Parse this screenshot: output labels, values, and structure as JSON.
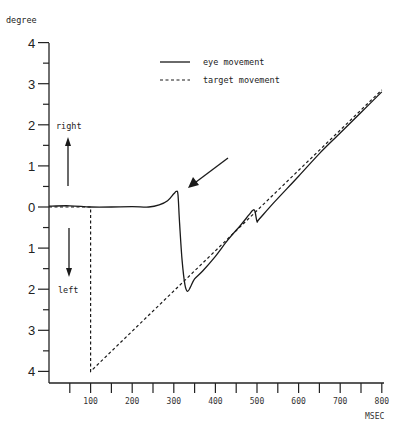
{
  "chart_data": {
    "type": "line",
    "title": "",
    "xlabel": "MSEC",
    "ylabel": "degree",
    "xlim": [
      0,
      800
    ],
    "ylim": [
      -4,
      4
    ],
    "x_ticks": [
      100,
      200,
      300,
      400,
      500,
      600,
      700,
      800
    ],
    "x_minor_ticks": [
      50,
      150,
      250,
      350,
      450,
      550,
      650,
      750
    ],
    "y_ticks": [
      {
        "value": 4,
        "label": "4"
      },
      {
        "value": 3,
        "label": "3"
      },
      {
        "value": 2,
        "label": "2"
      },
      {
        "value": 1,
        "label": "1"
      },
      {
        "value": 0,
        "label": "0"
      },
      {
        "value": -1,
        "label": "1"
      },
      {
        "value": -2,
        "label": "2"
      },
      {
        "value": -3,
        "label": "3"
      },
      {
        "value": -4,
        "label": "4"
      }
    ],
    "direction_labels": {
      "up": "right",
      "down": "left"
    },
    "legend": [
      {
        "label": "eye movement",
        "style": "solid"
      },
      {
        "label": "target movement",
        "style": "dashed"
      }
    ],
    "grid": false,
    "series": [
      {
        "name": "eye movement",
        "style": "solid",
        "points": [
          [
            0,
            0.02
          ],
          [
            50,
            0.03
          ],
          [
            100,
            0.0
          ],
          [
            150,
            0.0
          ],
          [
            200,
            0.01
          ],
          [
            240,
            0.0
          ],
          [
            265,
            0.05
          ],
          [
            285,
            0.15
          ],
          [
            300,
            0.32
          ],
          [
            306,
            0.38
          ],
          [
            310,
            0.3
          ],
          [
            314,
            -0.4
          ],
          [
            320,
            -1.3
          ],
          [
            327,
            -1.9
          ],
          [
            333,
            -2.05
          ],
          [
            340,
            -1.95
          ],
          [
            350,
            -1.75
          ],
          [
            370,
            -1.55
          ],
          [
            400,
            -1.2
          ],
          [
            430,
            -0.8
          ],
          [
            460,
            -0.45
          ],
          [
            480,
            -0.2
          ],
          [
            490,
            -0.08
          ],
          [
            495,
            -0.1
          ],
          [
            500,
            -0.35
          ],
          [
            505,
            -0.3
          ],
          [
            540,
            0.1
          ],
          [
            600,
            0.75
          ],
          [
            650,
            1.3
          ],
          [
            700,
            1.8
          ],
          [
            750,
            2.3
          ],
          [
            800,
            2.8
          ]
        ]
      },
      {
        "name": "target movement",
        "style": "dashed",
        "points": [
          [
            0,
            0
          ],
          [
            100,
            0
          ],
          [
            100,
            -4
          ],
          [
            800,
            2.85
          ]
        ]
      }
    ],
    "annotations": [
      {
        "type": "arrow",
        "from": [
          430,
          1.2
        ],
        "to": [
          318,
          0.55
        ],
        "note": "points at eye movement overshoot"
      }
    ]
  }
}
